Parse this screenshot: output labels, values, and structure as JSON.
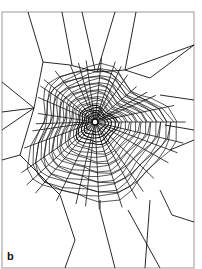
{
  "figure": {
    "panel_label": "b",
    "frame": {
      "x1": 2,
      "y1": 12,
      "x2": 194,
      "y2": 268,
      "color": "#999999"
    },
    "ink_color": "#111111",
    "hub": {
      "x": 95,
      "y": 122
    },
    "anchor_lines": [
      [
        28,
        12,
        43,
        62
      ],
      [
        62,
        12,
        72,
        65
      ],
      [
        82,
        12,
        95,
        70
      ],
      [
        115,
        12,
        97,
        72
      ],
      [
        136,
        12,
        125,
        70
      ],
      [
        43,
        62,
        70,
        65
      ],
      [
        70,
        65,
        97,
        72
      ],
      [
        97,
        72,
        125,
        70
      ],
      [
        125,
        70,
        150,
        78
      ],
      [
        150,
        78,
        194,
        45
      ],
      [
        125,
        70,
        194,
        45
      ],
      [
        2,
        82,
        34,
        108
      ],
      [
        2,
        112,
        34,
        108
      ],
      [
        2,
        130,
        34,
        108
      ],
      [
        34,
        108,
        43,
        62
      ],
      [
        34,
        108,
        20,
        155
      ],
      [
        20,
        155,
        60,
        195
      ],
      [
        20,
        155,
        2,
        160
      ],
      [
        194,
        100,
        160,
        95
      ],
      [
        194,
        130,
        165,
        125
      ],
      [
        194,
        140,
        170,
        150
      ],
      [
        160,
        190,
        172,
        215
      ],
      [
        172,
        215,
        194,
        222
      ],
      [
        150,
        200,
        145,
        268
      ],
      [
        60,
        195,
        75,
        240
      ],
      [
        75,
        240,
        65,
        268
      ],
      [
        100,
        210,
        115,
        268
      ],
      [
        128,
        210,
        150,
        250
      ],
      [
        150,
        250,
        160,
        268
      ],
      [
        100,
        200,
        100,
        210
      ]
    ],
    "radials_count": 34,
    "spiral_rings": 22,
    "spiral_inner_radius": 5,
    "spiral_outer": {
      "rx_left": 62,
      "rx_right": 70,
      "ry_top": 52,
      "ry_bottom": 85
    }
  }
}
